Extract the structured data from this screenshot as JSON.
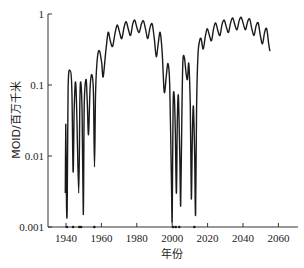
{
  "chart_data": {
    "type": "line",
    "title": "",
    "xlabel": "年份",
    "ylabel": "MOID/百万千米",
    "yscale": "log",
    "xlim": [
      1930,
      2070
    ],
    "ylim": [
      0.001,
      1
    ],
    "xticks": [
      1940,
      1960,
      1980,
      2000,
      2020,
      2040,
      2060
    ],
    "xtick_labels": [
      "1940",
      "1960",
      "1980",
      "2000",
      "2020",
      "2040",
      "2060"
    ],
    "yticks": [
      0.001,
      0.01,
      0.1,
      1
    ],
    "ytick_labels": [
      "0.001",
      "0.01",
      "0.1",
      "1"
    ],
    "grid": false,
    "legend": null,
    "line_color": "#1a1a1a",
    "close_approach_markers_years": [
      1940.5,
      1944,
      1947.5,
      1948.5,
      1956,
      2000.5,
      2002,
      2004,
      2012.5
    ],
    "series": [
      {
        "name": "MOID",
        "points": [
          [
            1939.6,
            0.003
          ],
          [
            1939.9,
            0.028
          ],
          [
            1940.3,
            0.002
          ],
          [
            1940.7,
            0.002
          ],
          [
            1941.2,
            0.09
          ],
          [
            1942.2,
            0.16
          ],
          [
            1943.3,
            0.09
          ],
          [
            1944.0,
            0.006
          ],
          [
            1944.6,
            0.04
          ],
          [
            1945.3,
            0.11
          ],
          [
            1946.0,
            0.05
          ],
          [
            1947.2,
            0.003
          ],
          [
            1947.8,
            0.05
          ],
          [
            1948.3,
            0.11
          ],
          [
            1949.1,
            0.04
          ],
          [
            1949.8,
            0.0015
          ],
          [
            1950.3,
            0.05
          ],
          [
            1951.3,
            0.12
          ],
          [
            1952.0,
            0.06
          ],
          [
            1952.7,
            0.02
          ],
          [
            1953.6,
            0.09
          ],
          [
            1954.6,
            0.14
          ],
          [
            1955.5,
            0.08
          ],
          [
            1956.1,
            0.007
          ],
          [
            1956.7,
            0.08
          ],
          [
            1957.8,
            0.25
          ],
          [
            1959.0,
            0.3
          ],
          [
            1960.2,
            0.2
          ],
          [
            1961.0,
            0.13
          ],
          [
            1962.5,
            0.3
          ],
          [
            1963.8,
            0.55
          ],
          [
            1965.0,
            0.42
          ],
          [
            1966.3,
            0.35
          ],
          [
            1967.8,
            0.55
          ],
          [
            1969.0,
            0.7
          ],
          [
            1970.3,
            0.55
          ],
          [
            1971.5,
            0.45
          ],
          [
            1972.8,
            0.65
          ],
          [
            1974.0,
            0.78
          ],
          [
            1975.3,
            0.6
          ],
          [
            1976.5,
            0.5
          ],
          [
            1977.7,
            0.72
          ],
          [
            1978.8,
            0.82
          ],
          [
            1980.0,
            0.65
          ],
          [
            1981.3,
            0.55
          ],
          [
            1982.6,
            0.72
          ],
          [
            1983.8,
            0.8
          ],
          [
            1985.0,
            0.6
          ],
          [
            1986.2,
            0.45
          ],
          [
            1987.5,
            0.65
          ],
          [
            1988.7,
            0.72
          ],
          [
            1989.9,
            0.45
          ],
          [
            1991.0,
            0.25
          ],
          [
            1992.2,
            0.4
          ],
          [
            1993.2,
            0.55
          ],
          [
            1994.3,
            0.3
          ],
          [
            1995.5,
            0.08
          ],
          [
            1996.6,
            0.13
          ],
          [
            1997.6,
            0.2
          ],
          [
            1998.6,
            0.1
          ],
          [
            1999.6,
            0.004
          ],
          [
            2000.0,
            0.0013
          ],
          [
            2000.5,
            0.05
          ],
          [
            2001.2,
            0.07
          ],
          [
            2001.8,
            0.02
          ],
          [
            2002.4,
            0.003
          ],
          [
            2002.9,
            0.03
          ],
          [
            2003.5,
            0.07
          ],
          [
            2004.3,
            0.01
          ],
          [
            2004.8,
            0.002
          ],
          [
            2005.4,
            0.03
          ],
          [
            2006.0,
            0.2
          ],
          [
            2006.8,
            0.25
          ],
          [
            2007.8,
            0.15
          ],
          [
            2008.6,
            0.12
          ],
          [
            2009.4,
            0.2
          ],
          [
            2010.2,
            0.05
          ],
          [
            2010.8,
            0.0025
          ],
          [
            2011.4,
            0.02
          ],
          [
            2012.0,
            0.05
          ],
          [
            2012.7,
            0.01
          ],
          [
            2013.2,
            0.0015
          ],
          [
            2013.8,
            0.05
          ],
          [
            2014.5,
            0.25
          ],
          [
            2015.3,
            0.4
          ],
          [
            2016.3,
            0.45
          ],
          [
            2017.5,
            0.32
          ],
          [
            2018.7,
            0.48
          ],
          [
            2019.8,
            0.62
          ],
          [
            2021.0,
            0.5
          ],
          [
            2022.2,
            0.42
          ],
          [
            2023.4,
            0.62
          ],
          [
            2024.6,
            0.75
          ],
          [
            2025.8,
            0.58
          ],
          [
            2027.0,
            0.5
          ],
          [
            2028.2,
            0.72
          ],
          [
            2029.4,
            0.82
          ],
          [
            2030.6,
            0.65
          ],
          [
            2031.8,
            0.55
          ],
          [
            2033.0,
            0.75
          ],
          [
            2034.2,
            0.88
          ],
          [
            2035.4,
            0.7
          ],
          [
            2036.6,
            0.6
          ],
          [
            2037.8,
            0.8
          ],
          [
            2039.0,
            0.9
          ],
          [
            2040.2,
            0.72
          ],
          [
            2041.4,
            0.6
          ],
          [
            2042.6,
            0.78
          ],
          [
            2043.8,
            0.85
          ],
          [
            2045.0,
            0.62
          ],
          [
            2046.2,
            0.5
          ],
          [
            2047.4,
            0.68
          ],
          [
            2048.6,
            0.75
          ],
          [
            2049.8,
            0.5
          ],
          [
            2051.0,
            0.38
          ],
          [
            2052.2,
            0.55
          ],
          [
            2053.4,
            0.62
          ],
          [
            2054.5,
            0.38
          ],
          [
            2055.2,
            0.3
          ]
        ]
      }
    ]
  }
}
